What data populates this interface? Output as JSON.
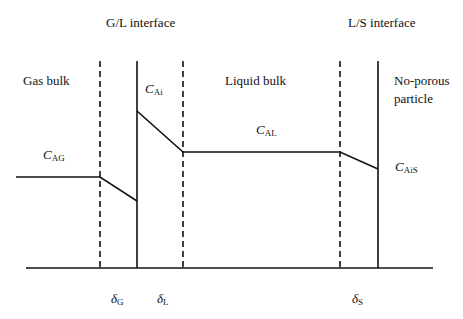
{
  "diagram": {
    "title_labels": {
      "gl_interface": "G/L interface",
      "ls_interface": "L/S interface"
    },
    "regions": {
      "gas_bulk": "Gas bulk",
      "liquid_bulk": "Liquid bulk",
      "particle_line1": "No-porous",
      "particle_line2": "particle"
    },
    "concentrations": [
      {
        "symbol": "C",
        "sub": "AG"
      },
      {
        "symbol": "C",
        "sub": "Ai"
      },
      {
        "symbol": "C",
        "sub": "AL"
      },
      {
        "symbol": "C",
        "sub": "AiS"
      }
    ],
    "film_thicknesses": [
      {
        "symbol": "δ",
        "sub": "G"
      },
      {
        "symbol": "δ",
        "sub": "L"
      },
      {
        "symbol": "δ",
        "sub": "S"
      }
    ],
    "line_color": "#111111"
  }
}
